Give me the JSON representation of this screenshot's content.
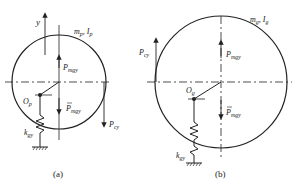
{
  "figure_a": {
    "caption": "(a)",
    "mass_label": "m",
    "mass_sub": "p",
    "inertia_label": "I",
    "inertia_sub": "p",
    "axis_label": "y",
    "force_up_label": "P",
    "force_up_sub": "mgy",
    "force_down_label": "P",
    "force_down_sub": "mgy",
    "pivot_label": "O",
    "pivot_sub": "p",
    "spring_label": "k",
    "spring_sub": "gy",
    "contact_force_label": "P",
    "contact_force_sub": "cy"
  },
  "figure_b": {
    "caption": "(b)",
    "mass_label": "m",
    "mass_sub": "g",
    "inertia_label": "I",
    "inertia_sub": "g",
    "force_up_label": "P",
    "force_up_sub": "mgy",
    "force_down_label": "P",
    "force_down_sub": "mgy",
    "pivot_label": "O",
    "pivot_sub": "g",
    "spring_label": "k",
    "spring_sub": "gy",
    "contact_force_label": "P",
    "contact_force_sub": "cy"
  }
}
